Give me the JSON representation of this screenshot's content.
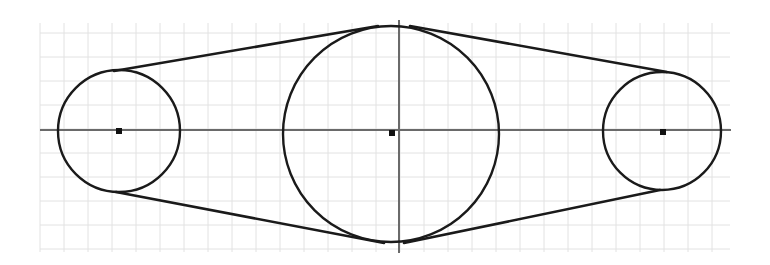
{
  "diagram": {
    "colors": {
      "background": "#ffffff",
      "grid": "#e2e2e2",
      "axis": "#6a6a6a",
      "stroke": "#1a1a1a"
    },
    "grid": {
      "x0": 40,
      "y0": 23,
      "x1": 730,
      "y1": 252,
      "spacing": 24
    },
    "axes": {
      "horizontal": {
        "x1": 40,
        "y1": 130,
        "x2": 731,
        "y2": 130
      },
      "vertical": {
        "x1": 399,
        "y1": 20,
        "x2": 399,
        "y2": 253
      }
    },
    "pulleys": [
      {
        "name": "left-pulley",
        "cx": 119,
        "cy": 131,
        "r": 61
      },
      {
        "name": "center-pulley",
        "cx": 391,
        "cy": 134,
        "r": 108
      },
      {
        "name": "right-pulley",
        "cx": 662,
        "cy": 131,
        "r": 59
      }
    ],
    "center_marks": [
      {
        "name": "left-center-mark",
        "x": 119,
        "y": 131
      },
      {
        "name": "center-center-mark",
        "x": 392,
        "y": 133
      },
      {
        "name": "right-center-mark",
        "x": 663,
        "y": 132
      }
    ],
    "belt_segments": [
      {
        "name": "belt-top-left",
        "x1": 114,
        "y1": 71,
        "x2": 378,
        "y2": 26
      },
      {
        "name": "belt-top-right",
        "x1": 410,
        "y1": 26,
        "x2": 667,
        "y2": 72
      },
      {
        "name": "belt-bottom-left",
        "x1": 116,
        "y1": 192,
        "x2": 384,
        "y2": 243
      },
      {
        "name": "belt-bottom-right",
        "x1": 404,
        "y1": 243,
        "x2": 660,
        "y2": 190
      }
    ]
  }
}
